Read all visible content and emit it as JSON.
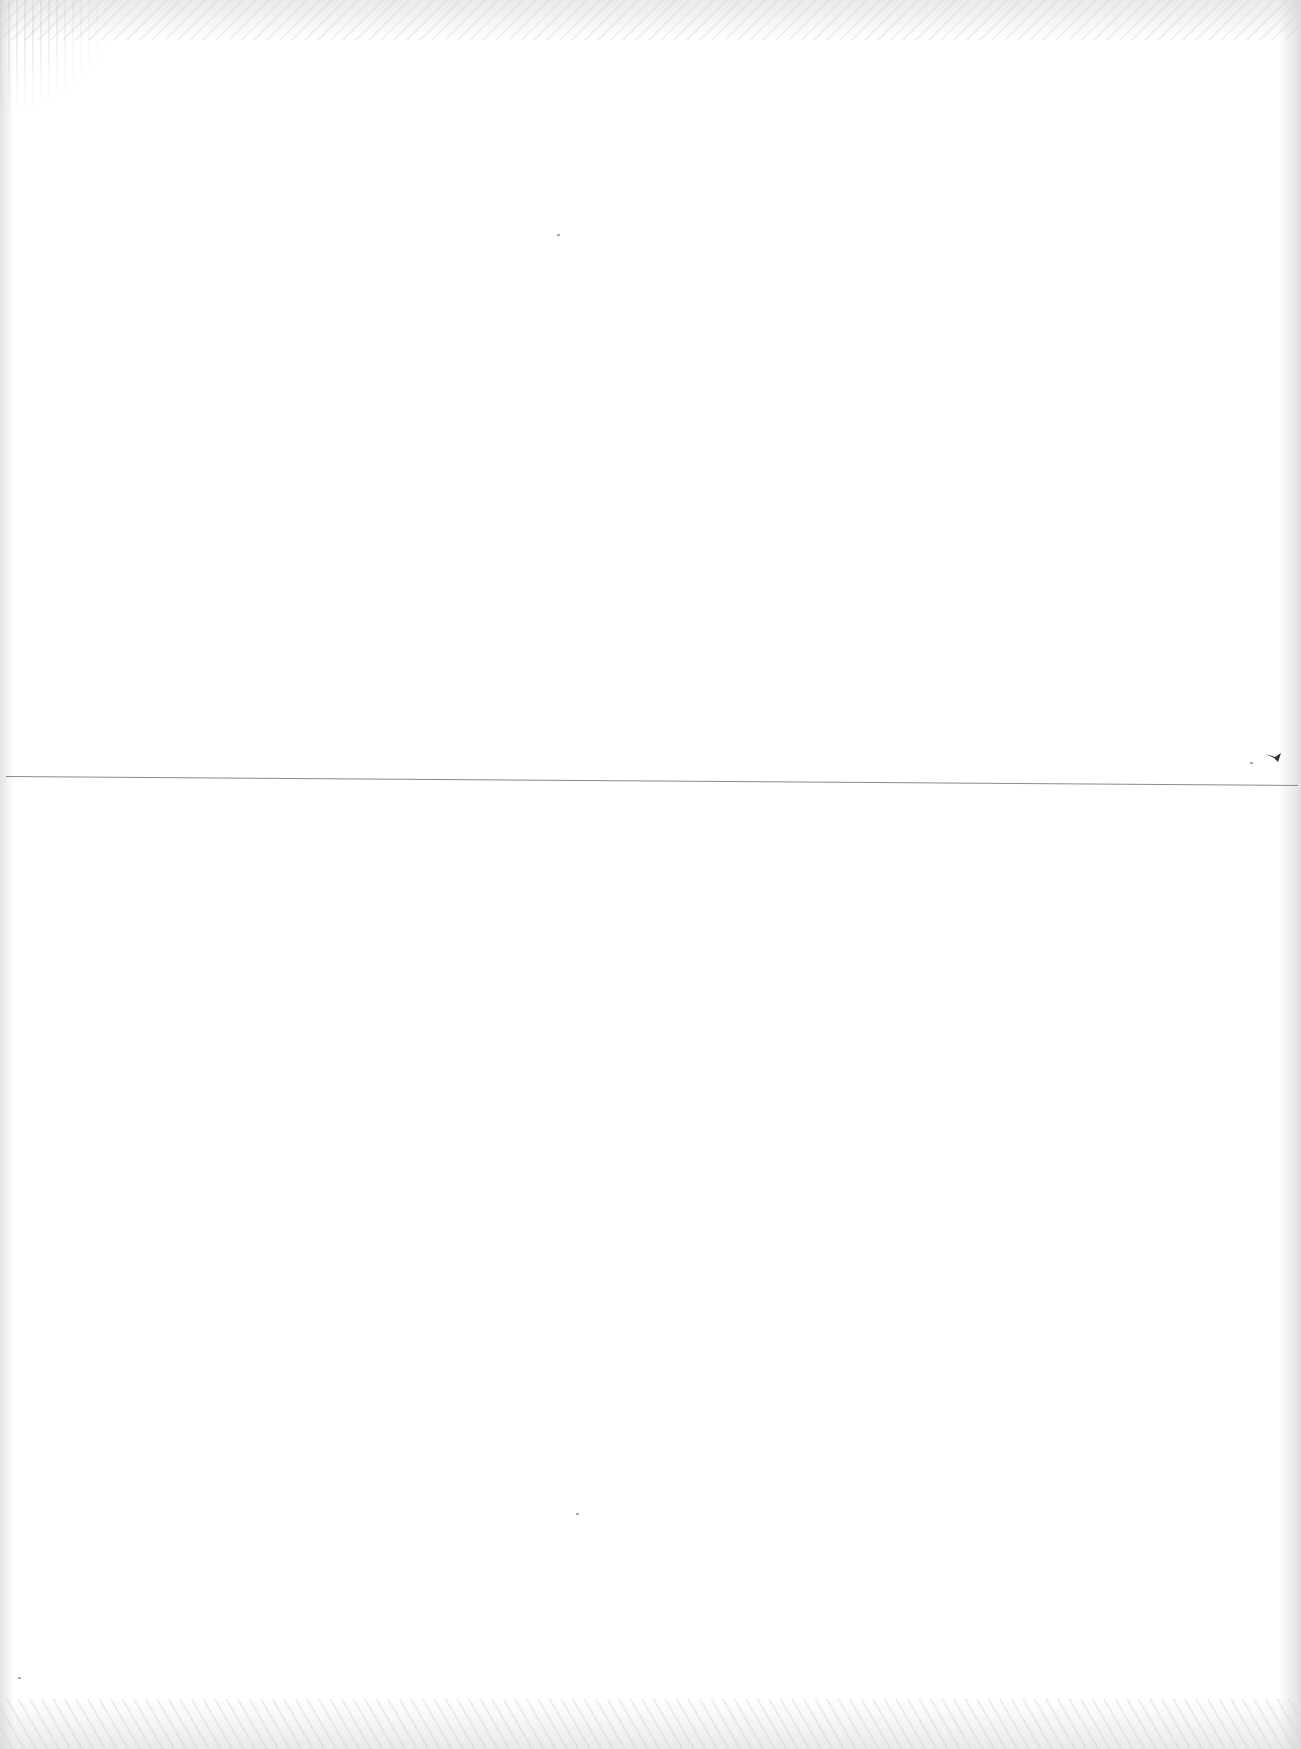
{
  "document": {
    "type": "blank scanned page",
    "text": "",
    "elements": {
      "horizontal_rule": {
        "orientation": "horizontal",
        "color": "#8a8a8a"
      },
      "ink_mark": {
        "description": "small dark mark near right end of rule",
        "color": "#333333"
      }
    },
    "background_color": "#ffffff"
  }
}
